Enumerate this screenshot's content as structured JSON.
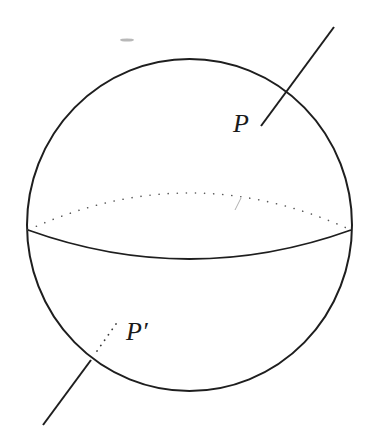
{
  "figure": {
    "labels": {
      "point_p": "P",
      "point_p_prime": "P′"
    },
    "colors": {
      "stroke": "#1e1e1e",
      "dotted": "#5a5a5a",
      "background": "#ffffff",
      "smudge": "#9a9a9a"
    }
  }
}
